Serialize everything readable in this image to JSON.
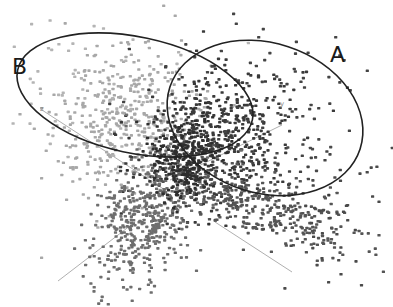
{
  "chart_data": {
    "type": "scatter",
    "title": "",
    "subtitle": "",
    "xlabel": "",
    "ylabel": "",
    "projection": "3d-point-cloud",
    "grid": false,
    "legend": null,
    "annotations": [
      {
        "label": "A",
        "x": 330,
        "y": 60,
        "shape": "ellipse",
        "cx": 265,
        "cy": 118,
        "rx": 100,
        "ry": 75,
        "rotate": 18
      },
      {
        "label": "B",
        "x": 12,
        "y": 72,
        "shape": "ellipse",
        "cx": 135,
        "cy": 95,
        "rx": 120,
        "ry": 58,
        "rotate": 12
      }
    ],
    "axes": [
      {
        "name": "z",
        "x1": 42,
        "y1": 110,
        "x2": 165,
        "y2": 190,
        "label_x": 40,
        "label_y": 111
      },
      {
        "name": "y",
        "x1": 170,
        "y1": 180,
        "x2": 282,
        "y2": 125,
        "label_x": 280,
        "label_y": 106
      },
      {
        "name": "x-neg",
        "x1": 58,
        "y1": 281,
        "x2": 135,
        "y2": 222,
        "label_x": null,
        "label_y": null
      },
      {
        "name": "x-pos",
        "x1": 215,
        "y1": 222,
        "x2": 292,
        "y2": 272,
        "label_x": null,
        "label_y": null
      }
    ],
    "series": [
      {
        "name": "cluster-B (light)",
        "color": "#a8a8a8",
        "count": 420,
        "cx": 128,
        "cy": 120,
        "sx": 40,
        "sy": 38,
        "rot": -0.9
      },
      {
        "name": "cluster-B sparse",
        "color": "#b4b4b4",
        "count": 80,
        "cx": 110,
        "cy": 90,
        "sx": 70,
        "sy": 35,
        "rot": 0.2
      },
      {
        "name": "cluster-A (dark)",
        "color": "#3a3a3a",
        "count": 520,
        "cx": 215,
        "cy": 140,
        "sx": 38,
        "sy": 32,
        "rot": -0.6
      },
      {
        "name": "cluster-A sparse",
        "color": "#444444",
        "count": 110,
        "cx": 270,
        "cy": 110,
        "sx": 60,
        "sy": 45,
        "rot": 0.0
      },
      {
        "name": "lower-left tail",
        "color": "#6e6e6e",
        "count": 480,
        "cx": 145,
        "cy": 220,
        "sx": 22,
        "sy": 38,
        "rot": 0.55
      },
      {
        "name": "lower-right arm",
        "color": "#555555",
        "count": 380,
        "cx": 255,
        "cy": 205,
        "sx": 50,
        "sy": 16,
        "rot": 0.35
      },
      {
        "name": "far-right sparse",
        "color": "#4a4a4a",
        "count": 60,
        "cx": 330,
        "cy": 215,
        "sx": 35,
        "sy": 40,
        "rot": 0.0
      },
      {
        "name": "center core",
        "color": "#2e2e2e",
        "count": 260,
        "cx": 185,
        "cy": 160,
        "sx": 18,
        "sy": 22,
        "rot": 0.0
      }
    ],
    "axis_ranges": {
      "x": [
        0,
        393
      ],
      "y": [
        0,
        307
      ]
    }
  },
  "labels": {
    "cluster_a": "A",
    "cluster_b": "B",
    "axis_z": "z",
    "axis_y": "y"
  },
  "colors": {
    "ellipse_stroke": "#222222",
    "axis_line": "#b0b0b0",
    "background": "#ffffff"
  }
}
